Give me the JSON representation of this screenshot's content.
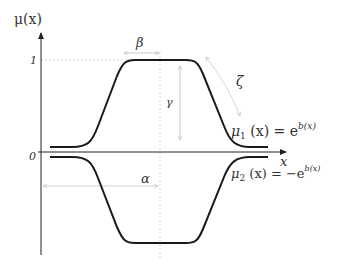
{
  "axes": {
    "y_label": "μ(x)",
    "x_label": "x",
    "tick_one": "1",
    "tick_zero": "0"
  },
  "annotations": {
    "beta": "β",
    "gamma": "γ",
    "zeta": "ζ",
    "alpha": "α"
  },
  "equations": {
    "mu1_lhs": "μ",
    "mu1_sub": "1",
    "mu1_mid": " (x) = e",
    "mu1_sup": "b(x)",
    "mu2_lhs": "μ",
    "mu2_sub": "2",
    "mu2_mid": " (x) = −e",
    "mu2_sup": "b(x)"
  },
  "colors": {
    "curve": "#1a1a1a",
    "axis": "#222222",
    "guide": "#c8c8c8"
  }
}
